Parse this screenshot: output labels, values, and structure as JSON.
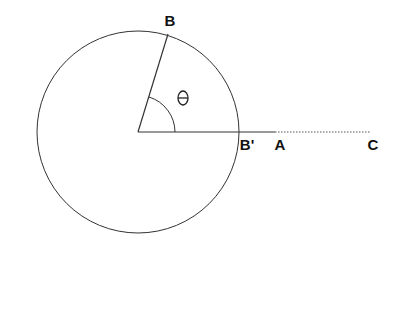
{
  "diagram": {
    "labels": {
      "B": "B",
      "B_prime": "B'",
      "A": "A",
      "C": "C",
      "theta": "Θ"
    },
    "stroke_color": "#333333",
    "background": "#ffffff"
  }
}
